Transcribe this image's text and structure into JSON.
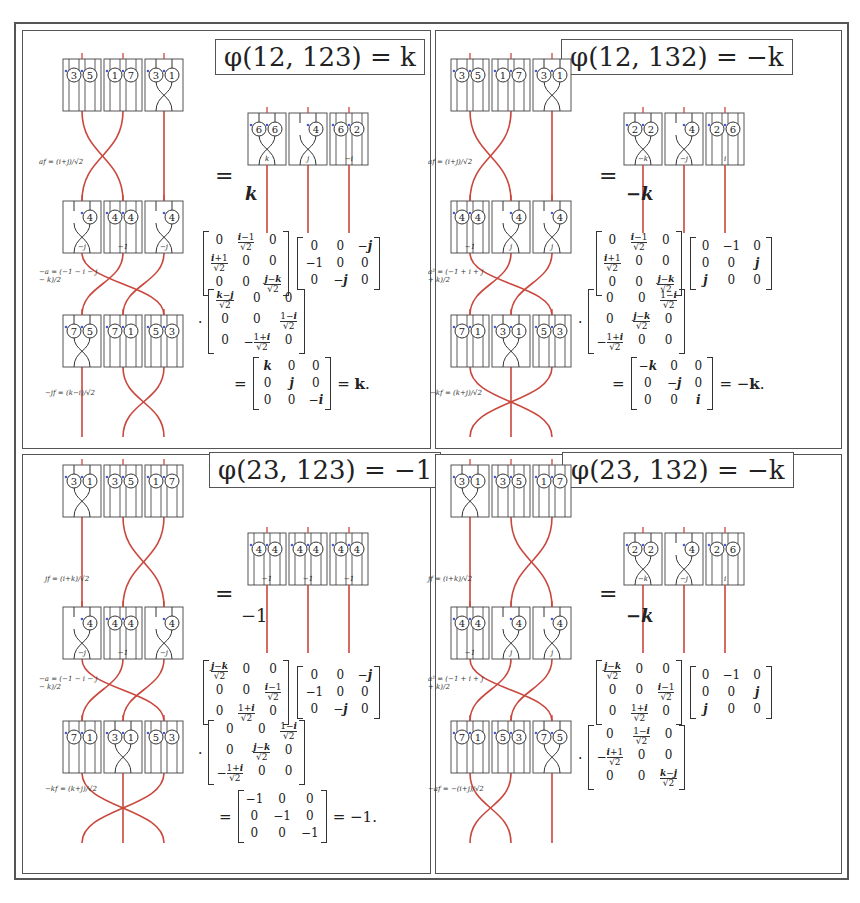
{
  "figure": {
    "panels": [
      {
        "title": "φ(12, 123) = k",
        "scalar": "k",
        "top_row": [
          [
            "3",
            "5"
          ],
          [
            "1",
            "7"
          ],
          [
            "3",
            "1"
          ]
        ],
        "mid_row": [
          [
            "4"
          ],
          [
            "4",
            "4"
          ],
          [
            "4"
          ]
        ],
        "mid_labels": [
          "−j",
          "−1",
          "−j"
        ],
        "bot_row": [
          [
            "7",
            "5"
          ],
          [
            "7",
            "1"
          ],
          [
            "5",
            "3"
          ]
        ],
        "result_row": [
          [
            "6",
            "6"
          ],
          [
            "4"
          ],
          [
            "6",
            "2"
          ]
        ],
        "result_labels": [
          "k",
          "j",
          "−i"
        ],
        "side_labels": [
          "af = (i+j)/√2",
          "−a = (−1 − i − j − k)/2",
          "−jf = (k−i)/√2"
        ],
        "matrices_line1": [
          [
            [
              "0",
              "(i−1)/√2",
              "0"
            ],
            [
              "(i+1)/√2",
              "0",
              "0"
            ],
            [
              "0",
              "0",
              "(j−k)/√2"
            ]
          ],
          [
            [
              "0",
              "0",
              "−j"
            ],
            [
              "−1",
              "0",
              "0"
            ],
            [
              "0",
              "−j",
              "0"
            ]
          ]
        ],
        "matrices_line2": [
          [
            [
              "(k−j)/√2",
              "0",
              "0"
            ],
            [
              "0",
              "0",
              "(1−i)/√2"
            ],
            [
              "0",
              "−(1+i)/√2",
              "0"
            ]
          ]
        ],
        "result_matrix": [
          [
            "k",
            "0",
            "0"
          ],
          [
            "0",
            "j",
            "0"
          ],
          [
            "0",
            "0",
            "−i"
          ]
        ],
        "result_value": "= k."
      },
      {
        "title": "φ(12, 132) = −k",
        "scalar": "−k",
        "top_row": [
          [
            "3",
            "5"
          ],
          [
            "1",
            "7"
          ],
          [
            "3",
            "1"
          ]
        ],
        "mid_row": [
          [
            "4",
            "4"
          ],
          [
            "4"
          ],
          [
            "4"
          ]
        ],
        "mid_labels": [
          "−1",
          "j",
          "j"
        ],
        "bot_row": [
          [
            "7",
            "1"
          ],
          [
            "3",
            "1"
          ],
          [
            "5",
            "3"
          ]
        ],
        "result_row": [
          [
            "2",
            "2"
          ],
          [
            "4"
          ],
          [
            "2",
            "6"
          ]
        ],
        "result_labels": [
          "−k",
          "−j",
          "i"
        ],
        "side_labels": [
          "af = (i+j)/√2",
          "a² = (−1 + i + j + k)/2",
          "−kf = (k+j)/√2"
        ],
        "matrices_line1": [
          [
            [
              "0",
              "(i−1)/√2",
              "0"
            ],
            [
              "(i+1)/√2",
              "0",
              "0"
            ],
            [
              "0",
              "0",
              "(j−k)/√2"
            ]
          ],
          [
            [
              "0",
              "−1",
              "0"
            ],
            [
              "0",
              "0",
              "j"
            ],
            [
              "j",
              "0",
              "0"
            ]
          ]
        ],
        "matrices_line2": [
          [
            [
              "0",
              "0",
              "(1−i)/√2"
            ],
            [
              "0",
              "(j−k)/√2",
              "0"
            ],
            [
              "−(1+i)/√2",
              "0",
              "0"
            ]
          ]
        ],
        "result_matrix": [
          [
            "−k",
            "0",
            "0"
          ],
          [
            "0",
            "−j",
            "0"
          ],
          [
            "0",
            "0",
            "i"
          ]
        ],
        "result_value": "= −k."
      },
      {
        "title": "φ(23, 123) = −1",
        "scalar": "−1",
        "top_row": [
          [
            "3",
            "1"
          ],
          [
            "3",
            "5"
          ],
          [
            "1",
            "7"
          ]
        ],
        "mid_row": [
          [
            "4"
          ],
          [
            "4",
            "4"
          ],
          [
            "4"
          ]
        ],
        "mid_labels": [
          "−j",
          "−1",
          "−j"
        ],
        "bot_row": [
          [
            "7",
            "1"
          ],
          [
            "3",
            "1"
          ],
          [
            "5",
            "3"
          ]
        ],
        "result_row": [
          [
            "4",
            "4"
          ],
          [
            "4",
            "4"
          ],
          [
            "4",
            "4"
          ]
        ],
        "result_labels": [
          "−1",
          "−1",
          "−1"
        ],
        "side_labels": [
          "jf = (i+k)/√2",
          "−a = (−1 − i − j − k)/2",
          "−kf = (k+j)/√2"
        ],
        "matrices_line1": [
          [
            [
              "(j−k)/√2",
              "0",
              "0"
            ],
            [
              "0",
              "0",
              "(i−1)/√2"
            ],
            [
              "0",
              "(1+i)/√2",
              "0"
            ]
          ],
          [
            [
              "0",
              "0",
              "−j"
            ],
            [
              "−1",
              "0",
              "0"
            ],
            [
              "0",
              "−j",
              "0"
            ]
          ]
        ],
        "matrices_line2": [
          [
            [
              "0",
              "0",
              "(1−i)/√2"
            ],
            [
              "0",
              "(j−k)/√2",
              "0"
            ],
            [
              "−(1+i)/√2",
              "0",
              "0"
            ]
          ]
        ],
        "result_matrix": [
          [
            "−1",
            "0",
            "0"
          ],
          [
            "0",
            "−1",
            "0"
          ],
          [
            "0",
            "0",
            "−1"
          ]
        ],
        "result_value": "= −1."
      },
      {
        "title": "φ(23, 132) = −k",
        "scalar": "−k",
        "top_row": [
          [
            "3",
            "1"
          ],
          [
            "3",
            "5"
          ],
          [
            "1",
            "7"
          ]
        ],
        "mid_row": [
          [
            "4",
            "4"
          ],
          [
            "4"
          ],
          [
            "4"
          ]
        ],
        "mid_labels": [
          "−1",
          "j",
          "j"
        ],
        "bot_row": [
          [
            "7",
            "1"
          ],
          [
            "5",
            "3"
          ],
          [
            "7",
            "5"
          ]
        ],
        "result_row": [
          [
            "2",
            "2"
          ],
          [
            "4"
          ],
          [
            "2",
            "6"
          ]
        ],
        "result_labels": [
          "−k",
          "−j",
          "i"
        ],
        "side_labels": [
          "jf = (i+k)/√2",
          "a² = (−1 + i + j + k)/2",
          "−af = −(i+j)/√2"
        ],
        "matrices_line1": [
          [
            [
              "(j−k)/√2",
              "0",
              "0"
            ],
            [
              "0",
              "0",
              "(i−1)/√2"
            ],
            [
              "0",
              "(1+i)/√2",
              "0"
            ]
          ],
          [
            [
              "0",
              "−1",
              "0"
            ],
            [
              "0",
              "0",
              "j"
            ],
            [
              "j",
              "0",
              "0"
            ]
          ]
        ],
        "matrices_line2": [
          [
            [
              "0",
              "(1−i)/√2",
              "0"
            ],
            [
              "−(i+1)/√2",
              "0",
              "0"
            ],
            [
              "0",
              "0",
              "(k−j)/√2"
            ]
          ]
        ],
        "result_matrix": null,
        "result_value": ""
      }
    ],
    "equals_sign": "=",
    "dot": "·"
  },
  "colors": {
    "strand": "#c9473d",
    "box": "#555555",
    "arrow": "#4a5bd0",
    "ink": "#222222"
  }
}
